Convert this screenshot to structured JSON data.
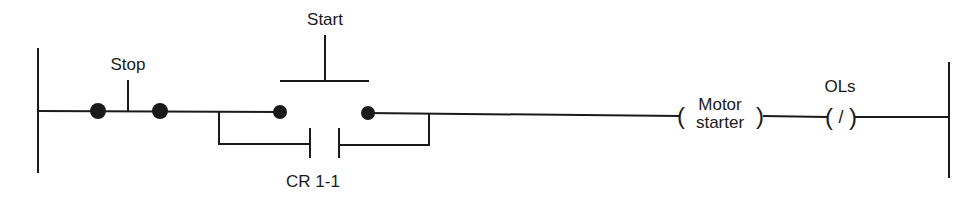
{
  "diagram": {
    "type": "ladder-logic",
    "labels": {
      "stop": "Stop",
      "start": "Start",
      "cr": "CR 1-1",
      "motor_line1": "Motor",
      "motor_line2": "starter",
      "ols": "OLs",
      "ols_symbol": "/",
      "coil_open": "(",
      "coil_close": ")"
    },
    "colors": {
      "line": "#1a1a1a",
      "background": "#ffffff"
    }
  }
}
